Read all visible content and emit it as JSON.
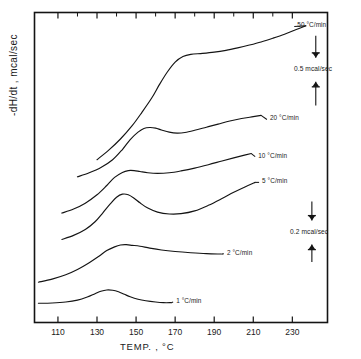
{
  "chart_data": {
    "type": "line",
    "title": "",
    "xlabel": "TEMP. , °C",
    "ylabel": "-dH/dt , mcal/sec",
    "xlim": [
      98,
      248
    ],
    "xticks": [
      110,
      130,
      150,
      170,
      190,
      210,
      230
    ],
    "xtick_labels": [
      "110",
      "130",
      "150",
      "170",
      "190",
      "210",
      "230"
    ],
    "ylim": [
      0,
      1
    ],
    "yticks": [],
    "ytick_labels": [],
    "grid": false,
    "legend_position": "inline-right-of-curves",
    "series": [
      {
        "name": "50 °C/min",
        "label": "50 °C/min",
        "label_x": 232,
        "label_y": 0.955,
        "x": [
          130,
          136,
          142,
          148,
          153,
          158,
          162,
          166,
          170,
          174,
          178,
          184,
          190,
          196,
          202,
          208,
          214,
          220,
          226,
          232,
          237
        ],
        "y": [
          0.525,
          0.556,
          0.592,
          0.635,
          0.678,
          0.724,
          0.768,
          0.808,
          0.84,
          0.858,
          0.865,
          0.868,
          0.872,
          0.878,
          0.886,
          0.895,
          0.905,
          0.917,
          0.93,
          0.945,
          0.957
        ]
      },
      {
        "name": "20 °C/min",
        "label": "20 °C/min",
        "label_x": 218,
        "label_y": 0.655,
        "x": [
          120,
          126,
          132,
          138,
          143,
          147,
          151,
          154,
          157,
          160,
          163,
          167,
          171,
          175,
          180,
          186,
          192,
          198,
          204,
          210,
          214
        ],
        "y": [
          0.47,
          0.483,
          0.5,
          0.525,
          0.558,
          0.59,
          0.614,
          0.626,
          0.629,
          0.627,
          0.621,
          0.614,
          0.611,
          0.613,
          0.62,
          0.63,
          0.64,
          0.65,
          0.658,
          0.664,
          0.668
        ]
      },
      {
        "name": "10 °C/min",
        "label": "10 °C/min",
        "label_x": 212,
        "label_y": 0.535,
        "x": [
          112,
          118,
          124,
          130,
          135,
          139,
          143,
          146,
          149,
          152,
          156,
          161,
          167,
          173,
          180,
          187,
          194,
          200,
          205,
          209
        ],
        "y": [
          0.353,
          0.366,
          0.385,
          0.412,
          0.442,
          0.468,
          0.484,
          0.49,
          0.49,
          0.487,
          0.483,
          0.481,
          0.483,
          0.489,
          0.498,
          0.509,
          0.521,
          0.531,
          0.539,
          0.545
        ]
      },
      {
        "name": "5 °C/min",
        "label": "5 °C/min",
        "label_x": 214,
        "label_y": 0.452,
        "x": [
          112,
          118,
          124,
          129,
          133,
          137,
          140,
          143,
          146,
          149,
          152,
          156,
          161,
          167,
          173,
          180,
          187,
          194,
          200,
          206,
          211
        ],
        "y": [
          0.268,
          0.281,
          0.3,
          0.325,
          0.354,
          0.384,
          0.404,
          0.414,
          0.412,
          0.401,
          0.386,
          0.369,
          0.356,
          0.35,
          0.351,
          0.36,
          0.378,
          0.4,
          0.42,
          0.438,
          0.452
        ]
      },
      {
        "name": "2 °C/min",
        "label": "2 °C/min",
        "label_x": 196,
        "label_y": 0.222,
        "x": [
          100,
          107,
          114,
          120,
          126,
          131,
          135,
          139,
          142,
          145,
          148,
          152,
          157,
          163,
          170,
          178,
          186,
          193,
          194
        ],
        "y": [
          0.13,
          0.14,
          0.154,
          0.171,
          0.193,
          0.214,
          0.232,
          0.244,
          0.25,
          0.251,
          0.249,
          0.246,
          0.24,
          0.234,
          0.229,
          0.225,
          0.222,
          0.221,
          0.221
        ]
      },
      {
        "name": "1 °C/min",
        "label": "1 °C/min",
        "label_x": 170,
        "label_y": 0.066,
        "x": [
          100,
          107,
          114,
          120,
          125,
          129,
          132,
          135,
          138,
          141,
          144,
          147,
          151,
          155,
          160,
          164,
          168
        ],
        "y": [
          0.062,
          0.063,
          0.066,
          0.072,
          0.082,
          0.093,
          0.101,
          0.105,
          0.104,
          0.099,
          0.091,
          0.083,
          0.075,
          0.07,
          0.066,
          0.064,
          0.064
        ]
      }
    ],
    "scale_bars": [
      {
        "label": "0.5 mcal/sec",
        "label_x": 238,
        "label_y": 0.815,
        "top_y": 0.925,
        "bottom_y": 0.7
      },
      {
        "label": "0.2 mcal/sec",
        "label_x": 236,
        "label_y": 0.29,
        "top_y": 0.39,
        "bottom_y": 0.195
      }
    ]
  },
  "axes": {
    "x_axis_label": "TEMP. , °C",
    "y_axis_label": "-dH/dt , mcal/sec"
  }
}
